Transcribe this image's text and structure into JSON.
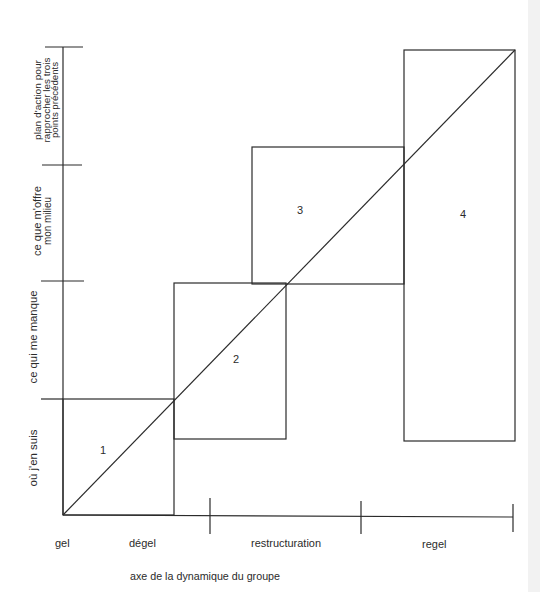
{
  "diagram": {
    "type": "group-dynamics-staircase",
    "vertical_axis": {
      "stages": [
        {
          "lines": [
            "où j'en suis"
          ]
        },
        {
          "lines": [
            "ce qui me manque"
          ]
        },
        {
          "lines": [
            "ce que m'offre",
            "mon milieu"
          ]
        },
        {
          "lines": [
            "plan d'action pour",
            "rapprocher les trois",
            "points précédents"
          ]
        }
      ]
    },
    "horizontal_axis": {
      "title": "axe de la dynamique du groupe",
      "phases": [
        "gel",
        "dégel",
        "restructuration",
        "regel"
      ]
    },
    "steps": [
      "1",
      "2",
      "3",
      "4"
    ]
  },
  "colors": {
    "line": "#2b2b2b",
    "text": "#2b2b2b",
    "background": "#ffffff",
    "page_edge": "#f2f2f2"
  }
}
